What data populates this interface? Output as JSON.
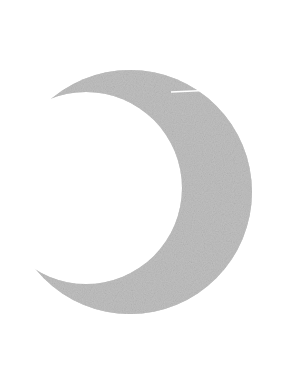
{
  "canvas": {
    "width": 282,
    "height": 372,
    "background_color": "#ffffff",
    "title": "Crescent moon silhouette"
  },
  "figure": {
    "name": "crescent-moon",
    "kind": "silhouette-shape",
    "fill_color": "#a9a9a9",
    "fill_texture": "grainy-noise",
    "texture_min_color": "#989898",
    "texture_max_color": "#b8b8b8",
    "stroke": "none",
    "orientation": "opening-left",
    "bounds": {
      "left": 32,
      "top": 56,
      "right": 251,
      "bottom": 329,
      "width": 219,
      "height": 273
    },
    "outer_arc": {
      "center_x": 130,
      "center_y": 192,
      "radius": 122
    },
    "inner_arc": {
      "center_x": 86,
      "center_y": 188,
      "radius": 96
    },
    "tips": {
      "top_tip_x": 158,
      "top_tip_y": 57,
      "bottom_tip_x": 32,
      "bottom_tip_y": 303
    }
  },
  "marks": {
    "white_line": {
      "name": "white-gap-line",
      "color": "#ffffff",
      "x_start": 171,
      "y_start": 92,
      "x_end": 215,
      "y_end": 90,
      "thickness": 1.6
    }
  }
}
